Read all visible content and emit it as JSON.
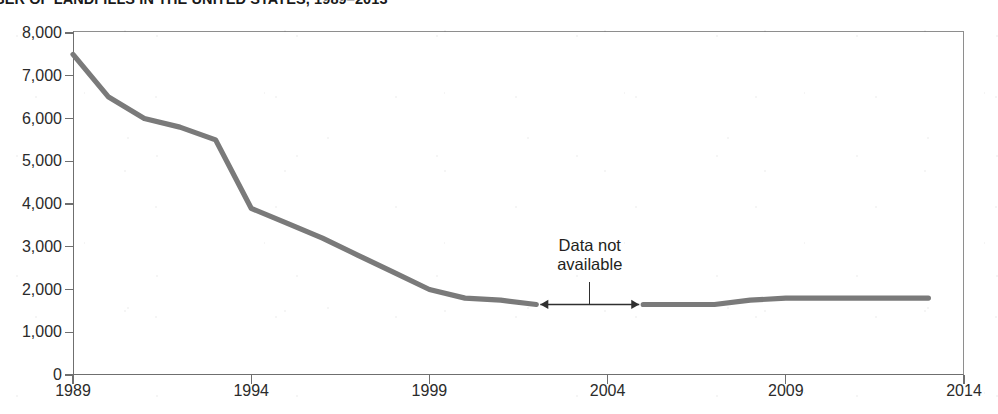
{
  "chart_data": {
    "type": "line",
    "title": "MBER OF LANDFILLS IN THE UNITED STATES, 1989–2013",
    "title_full_probable": "NUMBER OF LANDFILLS IN THE UNITED STATES, 1989–2013",
    "xlabel": "",
    "ylabel": "",
    "xlim": [
      1989,
      2014
    ],
    "ylim": [
      0,
      8000
    ],
    "grid": false,
    "legend": null,
    "line_color": "#7a7a7a",
    "axis_color": "#6f6f6f",
    "x_ticks": [
      "1989",
      "1994",
      "1999",
      "2004",
      "2009",
      "2014"
    ],
    "x_tick_values": [
      1989,
      1994,
      1999,
      2004,
      2009,
      2014
    ],
    "y_ticks": [
      "0",
      "1,000",
      "2,000",
      "3,000",
      "4,000",
      "5,000",
      "6,000",
      "7,000",
      "8,000"
    ],
    "y_tick_values": [
      0,
      1000,
      2000,
      3000,
      4000,
      5000,
      6000,
      7000,
      8000
    ],
    "series": [
      {
        "name": "Number of landfills",
        "x": [
          1989,
          1990,
          1991,
          1992,
          1993,
          1994,
          1995,
          1996,
          1997,
          1998,
          1999,
          2000,
          2001,
          2002
        ],
        "values": [
          7500,
          6500,
          6000,
          5800,
          5500,
          3900,
          3550,
          3200,
          2800,
          2400,
          2000,
          1800,
          1750,
          1650
        ]
      },
      {
        "name": "Number of landfills (resumed)",
        "x": [
          2005,
          2006,
          2007,
          2008,
          2009,
          2010,
          2011,
          2012,
          2013
        ],
        "values": [
          1650,
          1650,
          1650,
          1750,
          1800,
          1800,
          1800,
          1800,
          1800
        ]
      }
    ],
    "annotations": [
      {
        "text": "Data not\navailable",
        "line1": "Data not",
        "line2": "available",
        "x_start": 2002,
        "x_end": 2005,
        "y": 1650,
        "style": "double-headed-arrow-with-leader"
      }
    ]
  }
}
